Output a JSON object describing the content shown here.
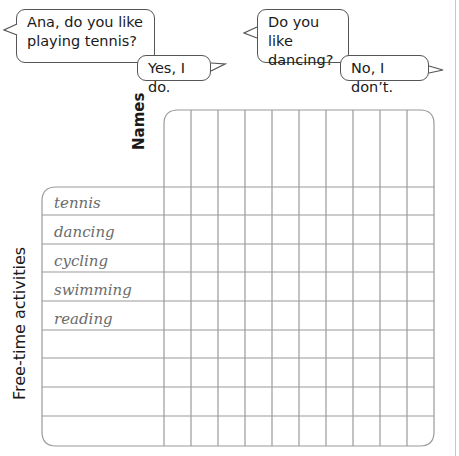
{
  "dialogue": {
    "example1": {
      "question": [
        "Ana, do you like",
        "playing tennis?"
      ],
      "answer": "Yes, I do."
    },
    "example2": {
      "question": [
        "Do you like",
        "dancing?"
      ],
      "answer": "No, I don’t."
    }
  },
  "survey_table": {
    "column_header_label": "Names",
    "row_header_label": "Free-time activities",
    "name_columns": 10,
    "activities": [
      "tennis",
      "dancing",
      "cycling",
      "swimming",
      "reading",
      "",
      "",
      "",
      ""
    ],
    "line_color": "#9a9a9a",
    "handwriting_color": "#6b6b6b"
  }
}
